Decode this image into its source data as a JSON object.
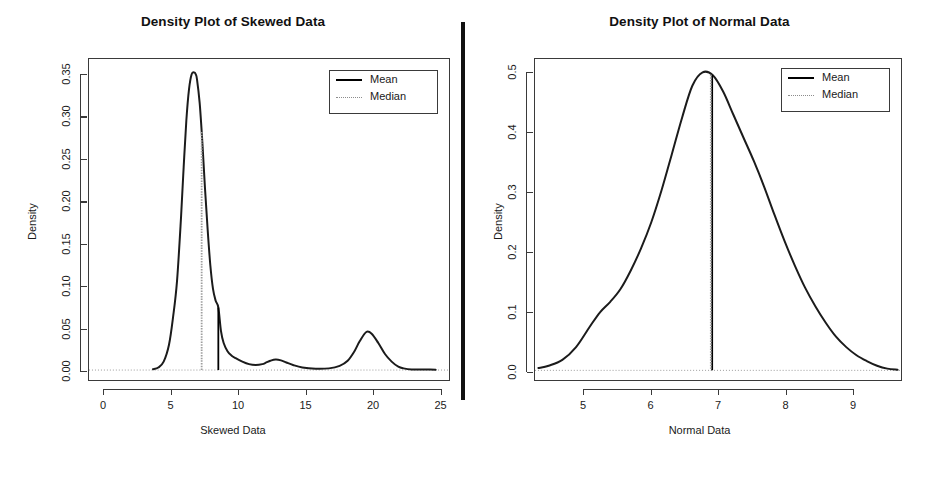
{
  "figure": {
    "width": 933,
    "height": 479,
    "background": "#ffffff",
    "divider": {
      "name": "vertical-separator-bar",
      "color": "#111111"
    }
  },
  "panels": [
    {
      "id": "left",
      "title": "Density Plot of Skewed Data",
      "xlabel": "Skewed Data",
      "ylabel": "Density",
      "legend": {
        "position": "top-right",
        "entries": [
          {
            "label": "Mean",
            "style": "solid",
            "color": "#000000"
          },
          {
            "label": "Median",
            "style": "dotted",
            "color": "#8c8c8c"
          }
        ]
      },
      "xticks": [
        "0",
        "5",
        "10",
        "15",
        "20",
        "25"
      ],
      "yticks": [
        "0.00",
        "0.05",
        "0.10",
        "0.15",
        "0.20",
        "0.25",
        "0.30",
        "0.35"
      ]
    },
    {
      "id": "right",
      "title": "Density Plot of Normal Data",
      "xlabel": "Normal Data",
      "ylabel": "Density",
      "legend": {
        "position": "top-right",
        "entries": [
          {
            "label": "Mean",
            "style": "solid",
            "color": "#000000"
          },
          {
            "label": "Median",
            "style": "dotted",
            "color": "#8c8c8c"
          }
        ]
      },
      "xticks": [
        "5",
        "6",
        "7",
        "8",
        "9"
      ],
      "yticks": [
        "0.0",
        "0.1",
        "0.2",
        "0.3",
        "0.4",
        "0.5"
      ]
    }
  ],
  "chart_data": [
    {
      "type": "line",
      "title": "Density Plot of Skewed Data",
      "xlabel": "Skewed Data",
      "ylabel": "Density",
      "xlim": [
        -1.0,
        26.0
      ],
      "ylim": [
        -0.012,
        0.368
      ],
      "grid": false,
      "legend_position": "top right",
      "annotations": [
        {
          "name": "mean-line",
          "type": "vline",
          "x": 8.7,
          "style": "solid",
          "color": "#000000"
        },
        {
          "name": "median-line",
          "type": "vline",
          "x": 7.45,
          "style": "dotted",
          "color": "#9e9e9e"
        },
        {
          "name": "zero-line",
          "type": "hline",
          "y": 0.0,
          "style": "dotted",
          "color": "#9a9a9a"
        }
      ],
      "series": [
        {
          "name": "Skewed Data density",
          "x": [
            3.8,
            4.2,
            4.6,
            5.0,
            5.3,
            5.6,
            5.9,
            6.1,
            6.3,
            6.5,
            6.7,
            6.9,
            7.0,
            7.1,
            7.3,
            7.5,
            7.7,
            7.9,
            8.1,
            8.3,
            8.5,
            8.7,
            8.9,
            9.1,
            9.4,
            9.7,
            10.0,
            10.5,
            11.0,
            11.5,
            12.0,
            12.3,
            12.6,
            13.0,
            13.4,
            13.8,
            14.3,
            15.0,
            16.0,
            17.0,
            17.8,
            18.4,
            18.9,
            19.3,
            19.8,
            20.2,
            20.7,
            21.2,
            21.7,
            22.2,
            22.6,
            23.2,
            25.0
          ],
          "y": [
            0.001,
            0.003,
            0.01,
            0.03,
            0.062,
            0.105,
            0.18,
            0.24,
            0.295,
            0.332,
            0.35,
            0.352,
            0.35,
            0.344,
            0.316,
            0.27,
            0.215,
            0.166,
            0.124,
            0.096,
            0.082,
            0.074,
            0.046,
            0.032,
            0.022,
            0.017,
            0.014,
            0.01,
            0.007,
            0.006,
            0.007,
            0.009,
            0.011,
            0.0125,
            0.0115,
            0.009,
            0.006,
            0.003,
            0.0015,
            0.002,
            0.005,
            0.011,
            0.022,
            0.034,
            0.045,
            0.043,
            0.032,
            0.019,
            0.01,
            0.004,
            0.002,
            0.0008,
            0.0005
          ]
        }
      ]
    },
    {
      "type": "line",
      "title": "Density Plot of Normal Data",
      "xlabel": "Normal Data",
      "ylabel": "Density",
      "xlim": [
        4.4,
        9.75
      ],
      "ylim": [
        -0.017,
        0.536
      ],
      "grid": false,
      "legend_position": "top right",
      "annotations": [
        {
          "name": "mean-line",
          "type": "vline",
          "x": 6.99,
          "style": "solid",
          "color": "#000000"
        },
        {
          "name": "median-line",
          "type": "vline",
          "x": 6.97,
          "style": "dotted",
          "color": "#9e9e9e"
        },
        {
          "name": "zero-line",
          "type": "hline",
          "y": 0.0,
          "style": "dotted",
          "color": "#9a9a9a"
        }
      ],
      "series": [
        {
          "name": "Normal Data density",
          "x": [
            4.45,
            4.6,
            4.8,
            5.0,
            5.2,
            5.35,
            5.5,
            5.65,
            5.8,
            5.95,
            6.1,
            6.25,
            6.4,
            6.55,
            6.7,
            6.85,
            7.0,
            7.15,
            7.3,
            7.45,
            7.6,
            7.75,
            7.9,
            8.05,
            8.2,
            8.35,
            8.5,
            8.65,
            8.8,
            8.95,
            9.1,
            9.25,
            9.4,
            9.55,
            9.7
          ],
          "y": [
            0.004,
            0.008,
            0.018,
            0.04,
            0.075,
            0.1,
            0.118,
            0.14,
            0.172,
            0.21,
            0.255,
            0.31,
            0.372,
            0.435,
            0.49,
            0.513,
            0.508,
            0.48,
            0.44,
            0.4,
            0.36,
            0.316,
            0.268,
            0.222,
            0.18,
            0.142,
            0.11,
            0.082,
            0.058,
            0.04,
            0.026,
            0.016,
            0.008,
            0.003,
            0.001
          ]
        }
      ]
    }
  ]
}
